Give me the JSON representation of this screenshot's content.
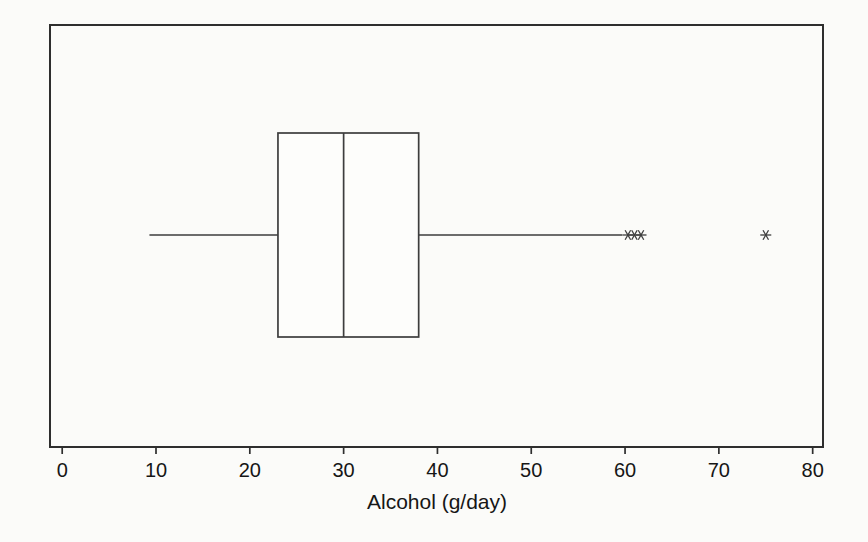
{
  "page": {
    "background": "#fbfbf9"
  },
  "chart_data": {
    "type": "boxplot",
    "orientation": "horizontal",
    "title": "",
    "xlabel": "Alcohol (g/day)",
    "ylabel": "",
    "xlim": [
      -1.3,
      81.1
    ],
    "xticks": [
      0,
      10,
      20,
      30,
      40,
      50,
      60,
      70,
      80
    ],
    "grid": false,
    "frame": true,
    "legend": "none",
    "series": [
      {
        "name": "Alcohol (g/day)",
        "whisker_low": 9.3,
        "q1": 23,
        "median": 30,
        "q3": 38,
        "whisker_high": 59.7,
        "outliers": [
          60.3,
          61,
          61.7,
          75
        ],
        "outlier_marker": "asterisk"
      }
    ],
    "colors": {
      "line": "#3d3d3d",
      "frame": "#2e2e2e",
      "box_fill": "#fdfdfb",
      "text": "#161616"
    }
  }
}
